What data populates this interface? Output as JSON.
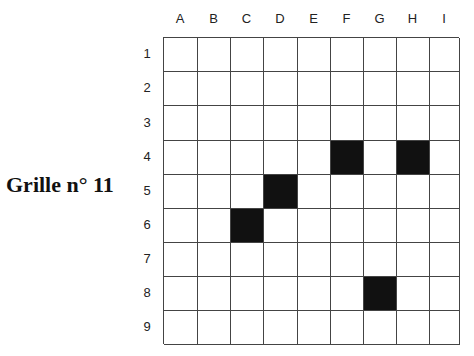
{
  "title": "Grille n° 11",
  "columns": [
    "A",
    "B",
    "C",
    "D",
    "E",
    "F",
    "G",
    "H",
    "I"
  ],
  "rows": [
    "1",
    "2",
    "3",
    "4",
    "5",
    "6",
    "7",
    "8",
    "9"
  ],
  "filled_cells": [
    "F4",
    "H4",
    "D5",
    "C6",
    "G8"
  ],
  "colors": {
    "filled": "#111111",
    "empty": "#ffffff",
    "line": "#444444"
  }
}
